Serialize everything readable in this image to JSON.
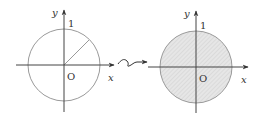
{
  "diagram": {
    "title": "",
    "colors": {
      "axis": "#444444",
      "circle": "#9a9a9a",
      "fill": "#e4e4e4",
      "hatch": "#c8c8c8"
    },
    "left_panel": {
      "y_axis_label": "y",
      "x_axis_label": "x",
      "origin_label": "O",
      "radius_label": "1",
      "description": "Unit circle with a radius segment drawn at 45°"
    },
    "transform_arrow": {
      "description": "wavy arrow indicating transformation"
    },
    "right_panel": {
      "y_axis_label": "y",
      "x_axis_label": "x",
      "origin_label": "O",
      "radius_label": "1",
      "description": "Unit disk shaded (hatched)"
    }
  }
}
